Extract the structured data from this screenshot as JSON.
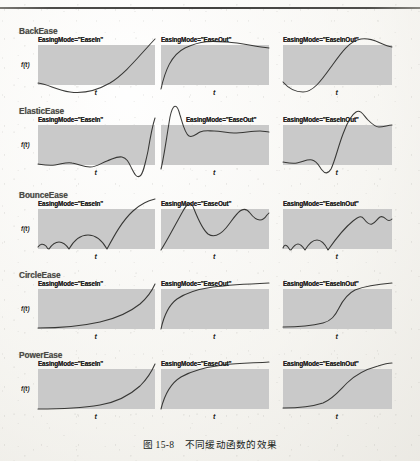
{
  "page": {
    "caption": "图 15-8　不同缓动函数的效果",
    "axis_y_label": "f(t)",
    "axis_x_label": "t",
    "plot_fill_color": "#c9c9c9",
    "curve_color": "#2a2a28",
    "paper_color": "#faf9f6",
    "rule_color": "#2e2d2b"
  },
  "groups": [
    {
      "name": "BackEase",
      "top": 26,
      "panels": [
        {
          "label": "EasingMode=\"EaseIn\"",
          "left": 38,
          "label_left": 38,
          "width": 117,
          "height": 40,
          "curve": "M0,38 C10,39 18,45 32,47 C46,49 58,46 72,38 C88,28 100,12 117,-6"
        },
        {
          "label": "EasingMode=\"EaseOut\"",
          "left": 161,
          "label_left": 161,
          "width": 108,
          "height": 40,
          "curve": "M0,44 C4,26 10,10 24,3 C40,-5 52,-4 66,-3 C80,-2 92,1 108,3"
        },
        {
          "label": "EasingMode=\"EaseInOut\"",
          "left": 283,
          "label_left": 283,
          "width": 109,
          "height": 40,
          "curve": "M0,37 C6,44 12,47 20,47 C30,47 38,36 48,22 C58,8 66,-4 78,-6 C90,-8 98,0 109,2"
        }
      ]
    },
    {
      "name": "ElasticEase",
      "top": 106,
      "panels": [
        {
          "label": "EasingMode=\"EaseIn\"",
          "left": 38,
          "label_left": 38,
          "width": 117,
          "height": 40,
          "curve": "M0,39 C6,40 11,41 17,40 C24,39 28,37 34,38 C41,39 45,42 52,42 C59,42 63,38 69,36 C75,34 79,31 84,32 C89,33 91,38 94,44 C97,50 99,53 102,51 C105,49 107,40 110,26 C112,14 114,2 117,-7"
        },
        {
          "label": "EasingMode=\"EaseOut\"",
          "left": 161,
          "label_left": 186,
          "width": 108,
          "height": 40,
          "curve": "M0,44 C3,32 5,16 9,-8 C12,-22 16,-22 19,-10 C22,0 24,9 28,11 C32,13 35,9 39,7 C44,5 48,6 53,6 C60,6 66,8 73,8 C82,8 90,6 99,6 C103,6 105,7 108,7"
        },
        {
          "label": "EasingMode=\"EaseInOut\"",
          "left": 283,
          "label_left": 283,
          "width": 109,
          "height": 40,
          "curve": "M0,37 C5,38 9,39 14,38 C20,37 24,34 29,35 C34,36 36,41 39,45 C42,49 45,49 48,44 C52,36 55,22 60,9 C64,-2 68,-10 73,-13 C78,-16 81,-9 85,-5 C89,-1 92,2 96,2 C101,2 105,0 109,0"
        }
      ]
    },
    {
      "name": "BounceEase",
      "top": 190,
      "panels": [
        {
          "label": "EasingMode=\"EaseIn\"",
          "left": 38,
          "label_left": 38,
          "width": 117,
          "height": 40,
          "curve": "M0,38 C2,35 5,34 8,37 C9,39 10,40 11,40 C13,37 16,33 21,33 C26,33 29,37 31,40 C35,33 41,26 50,26 C59,26 65,33 69,40 C76,27 84,12 95,2 C104,-6 110,-8 117,-10"
        },
        {
          "label": "EasingMode=\"EaseOut\"",
          "left": 161,
          "label_left": 161,
          "width": 108,
          "height": 40,
          "curve": "M0,41 C6,32 13,18 22,2 C27,-7 30,-8 33,0 C37,10 41,20 47,25 C53,29 59,26 65,19 C70,13 74,6 79,2 C83,-1 86,0 89,4 C92,8 95,11 99,11 C102,11 104,9 106,6 C107,5 108,4 108,4"
        },
        {
          "label": "EasingMode=\"EaseInOut\"",
          "left": 283,
          "label_left": 283,
          "width": 109,
          "height": 40,
          "curve": "M0,39 C1,36 3,35 5,38 C6,40 7,41 8,41 C10,38 12,35 15,35 C18,35 20,38 22,41 C25,36 29,31 34,31 C39,31 42,35 45,41 C52,31 60,20 70,12 C75,8 78,6 81,10 C84,14 86,16 89,15 C92,14 94,10 97,8 C99,7 101,8 103,10 C105,12 107,12 109,10"
        }
      ]
    },
    {
      "name": "CircleEase",
      "top": 270,
      "panels": [
        {
          "label": "EasingMode=\"EaseIn\"",
          "left": 38,
          "label_left": 38,
          "width": 117,
          "height": 40,
          "curve": "M0,39 C20,39 44,37 62,33 C80,29 92,23 102,15 C110,8 114,2 117,-5"
        },
        {
          "label": "EasingMode=\"EaseOut\"",
          "left": 161,
          "label_left": 161,
          "width": 108,
          "height": 40,
          "curve": "M0,40 C3,26 8,16 16,10 C26,3 38,0 52,-2 C68,-4 86,-5 108,-6"
        },
        {
          "label": "EasingMode=\"EaseInOut\"",
          "left": 283,
          "label_left": 283,
          "width": 109,
          "height": 40,
          "curve": "M0,38 C12,38 28,37 40,34 C48,32 52,27 56,19 C60,11 64,5 72,1 C82,-3 96,-5 109,-6"
        }
      ]
    },
    {
      "name": "PowerEase",
      "top": 350,
      "panels": [
        {
          "label": "EasingMode=\"EaseIn\"",
          "left": 38,
          "label_left": 38,
          "width": 117,
          "height": 40,
          "curve": "M0,40 C22,40 44,39 62,36 C80,33 92,26 102,17 C110,9 114,2 117,-5"
        },
        {
          "label": "EasingMode=\"EaseOut\"",
          "left": 161,
          "label_left": 161,
          "width": 108,
          "height": 40,
          "curve": "M0,40 C4,24 10,14 20,8 C32,1 46,-2 62,-4 C78,-6 94,-6 108,-7"
        },
        {
          "label": "EasingMode=\"EaseInOut\"",
          "left": 283,
          "label_left": 283,
          "width": 109,
          "height": 40,
          "curve": "M0,39 C14,39 28,38 40,34 C50,30 56,22 64,14 C72,6 84,0 95,-3 C101,-5 105,-6 109,-6"
        }
      ]
    }
  ],
  "caption_top": 437
}
